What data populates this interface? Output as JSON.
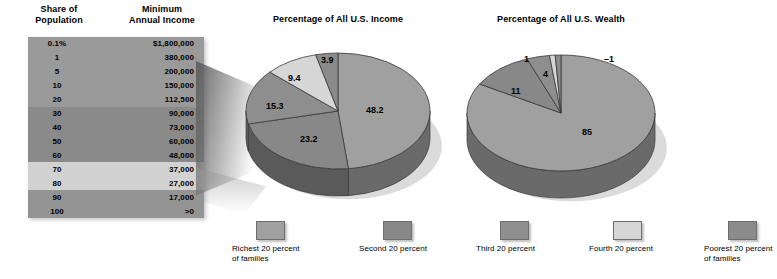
{
  "table": {
    "header_share": "Share of\nPopulation",
    "header_share_l1": "Share of",
    "header_share_l2": "Population",
    "header_income_l1": "Minimum",
    "header_income_l2": "Annual Income",
    "rows": [
      {
        "share": "0.1%",
        "income": "$1,800,000",
        "band": 0
      },
      {
        "share": "1",
        "income": "380,000",
        "band": 0
      },
      {
        "share": "5",
        "income": "200,000",
        "band": 0
      },
      {
        "share": "10",
        "income": "150,000",
        "band": 0
      },
      {
        "share": "20",
        "income": "112,500",
        "band": 0
      },
      {
        "share": "30",
        "income": "90,000",
        "band": 1
      },
      {
        "share": "40",
        "income": "73,000",
        "band": 1
      },
      {
        "share": "50",
        "income": "60,000",
        "band": 1
      },
      {
        "share": "60",
        "income": "48,000",
        "band": 1
      },
      {
        "share": "70",
        "income": "37,000",
        "band": 2
      },
      {
        "share": "80",
        "income": "27,000",
        "band": 2
      },
      {
        "share": "90",
        "income": "17,000",
        "band": 3
      },
      {
        "share": "100",
        "income": ">0",
        "band": 3
      }
    ],
    "band_colors": [
      "#9a9a9a",
      "#8a8a8a",
      "#d2d2d2",
      "#949494"
    ]
  },
  "legend": {
    "items": [
      {
        "label_l1": "Richest 20 percent",
        "label_l2": "of families",
        "color": "#a0a0a0"
      },
      {
        "label_l1": "Second 20 percent",
        "label_l2": "",
        "color": "#888888"
      },
      {
        "label_l1": "Third 20 percent",
        "label_l2": "",
        "color": "#8e8e8e"
      },
      {
        "label_l1": "Fourth 20 percent",
        "label_l2": "",
        "color": "#d6d6d6"
      },
      {
        "label_l1": "Poorest 20 percent",
        "label_l2": "of families",
        "color": "#8b8b8b"
      }
    ]
  },
  "chart_data": [
    {
      "type": "pie",
      "title": "Percentage of All U.S. Income",
      "categories": [
        "Richest 20 percent of families",
        "Second 20 percent",
        "Third 20 percent",
        "Fourth 20 percent",
        "Poorest 20 percent of families"
      ],
      "values": [
        48.2,
        23.2,
        15.3,
        9.4,
        3.9
      ],
      "labels": [
        "48.2",
        "23.2",
        "15.3",
        "9.4",
        "3.9"
      ],
      "colors": [
        "#a0a0a0",
        "#888888",
        "#8e8e8e",
        "#d6d6d6",
        "#8b8b8b"
      ],
      "legend_position": "bottom",
      "grid": false
    },
    {
      "type": "pie",
      "title": "Percentage of All U.S. Wealth",
      "categories": [
        "Richest 20 percent of families",
        "Second 20 percent",
        "Third 20 percent",
        "Fourth 20 percent",
        "Poorest 20 percent of families"
      ],
      "values": [
        85,
        11,
        4,
        1,
        -1
      ],
      "labels": [
        "85",
        "11",
        "4",
        "1",
        "–1"
      ],
      "colors": [
        "#a0a0a0",
        "#888888",
        "#8e8e8e",
        "#d6d6d6",
        "#8b8b8b"
      ],
      "legend_position": "bottom",
      "grid": false
    }
  ]
}
